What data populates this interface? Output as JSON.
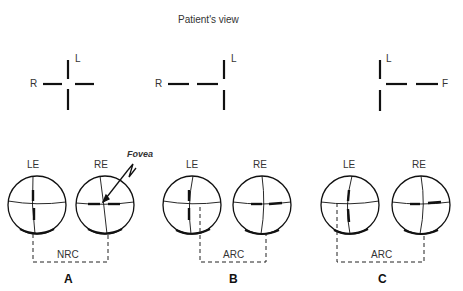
{
  "title": "Patient's view",
  "patient_views": [
    {
      "id": "A",
      "left_label": "R",
      "top_label": "L",
      "pattern": "cross-centered"
    },
    {
      "id": "B",
      "left_label": "R",
      "top_label": "L",
      "pattern": "horizontal-shifted-left"
    },
    {
      "id": "C",
      "right_label": "F",
      "top_label": "L",
      "pattern": "horizontal-shifted-right"
    }
  ],
  "panels": [
    {
      "letter": "A",
      "left_eye": "LE",
      "right_eye": "RE",
      "correspondence": "NRC",
      "annotation": "Fovea"
    },
    {
      "letter": "B",
      "left_eye": "LE",
      "right_eye": "RE",
      "correspondence": "ARC"
    },
    {
      "letter": "C",
      "left_eye": "LE",
      "right_eye": "RE",
      "correspondence": "ARC"
    }
  ],
  "colors": {
    "ink": "#111111",
    "background": "#ffffff"
  }
}
